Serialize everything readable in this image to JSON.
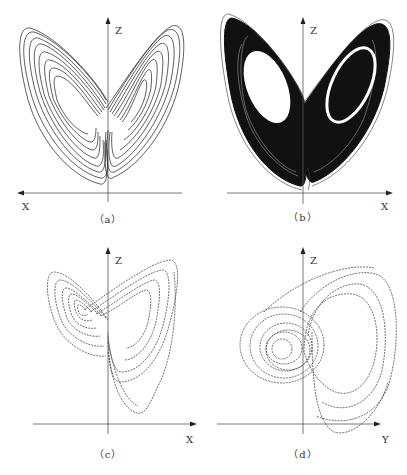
{
  "figure": {
    "panels": [
      {
        "id": "a",
        "caption": "（a）",
        "vertical_axis": "Z",
        "horizontal_axis": "X",
        "horizontal_arrow": "left",
        "style": "sparse-trajectory"
      },
      {
        "id": "b",
        "caption": "（b）",
        "vertical_axis": "Z",
        "horizontal_axis": "X",
        "horizontal_arrow": "right",
        "style": "dense-trajectory"
      },
      {
        "id": "c",
        "caption": "（c）",
        "vertical_axis": "Z",
        "horizontal_axis": "X",
        "horizontal_arrow": "right",
        "style": "dashed-trajectory"
      },
      {
        "id": "d",
        "caption": "（d）",
        "vertical_axis": "Z",
        "horizontal_axis": "Y",
        "horizontal_arrow": "right",
        "style": "dashed-trajectory"
      }
    ],
    "colors": {
      "ink": "#1a1a1a",
      "axis": "#555555",
      "background": "#ffffff"
    }
  }
}
